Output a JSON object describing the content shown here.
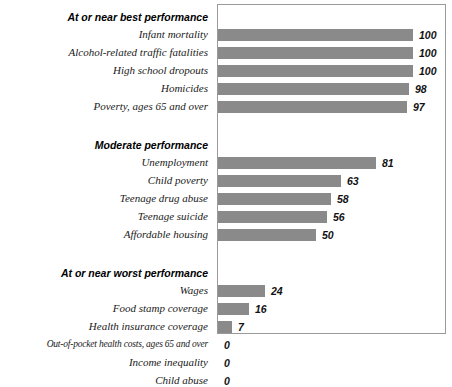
{
  "chart_data": {
    "type": "bar",
    "orientation": "horizontal",
    "title": "",
    "xlabel": "",
    "ylabel": "",
    "xlim": [
      0,
      100
    ],
    "grid": false,
    "legend": null,
    "bar_color": "#8a8a8a",
    "groups": [
      {
        "header": "At or near best performance",
        "items": [
          {
            "label": "Infant mortality",
            "value": 100
          },
          {
            "label": "Alcohol-related traffic fatalities",
            "value": 100
          },
          {
            "label": "High school dropouts",
            "value": 100
          },
          {
            "label": "Homicides",
            "value": 98
          },
          {
            "label": "Poverty, ages 65 and over",
            "value": 97
          }
        ]
      },
      {
        "header": "Moderate performance",
        "items": [
          {
            "label": "Unemployment",
            "value": 81
          },
          {
            "label": "Child poverty",
            "value": 63
          },
          {
            "label": "Teenage drug abuse",
            "value": 58
          },
          {
            "label": "Teenage suicide",
            "value": 56
          },
          {
            "label": "Affordable housing",
            "value": 50
          }
        ]
      },
      {
        "header": "At or near worst performance",
        "items": [
          {
            "label": "Wages",
            "value": 24
          },
          {
            "label": "Food stamp coverage",
            "value": 16
          },
          {
            "label": "Health insurance coverage",
            "value": 7
          },
          {
            "label": "Out-of-pocket health costs, ages 65 and over",
            "value": 0
          },
          {
            "label": "Income inequality",
            "value": 0
          },
          {
            "label": "Child abuse",
            "value": 0
          }
        ]
      }
    ],
    "categories": [
      "Infant mortality",
      "Alcohol-related traffic fatalities",
      "High school dropouts",
      "Homicides",
      "Poverty, ages 65 and over",
      "Unemployment",
      "Child poverty",
      "Teenage drug abuse",
      "Teenage suicide",
      "Affordable housing",
      "Wages",
      "Food stamp coverage",
      "Health insurance coverage",
      "Out-of-pocket health costs, ages 65 and over",
      "Income inequality",
      "Child abuse"
    ],
    "values": [
      100,
      100,
      100,
      98,
      97,
      81,
      63,
      58,
      56,
      50,
      24,
      16,
      7,
      0,
      0,
      0
    ]
  }
}
